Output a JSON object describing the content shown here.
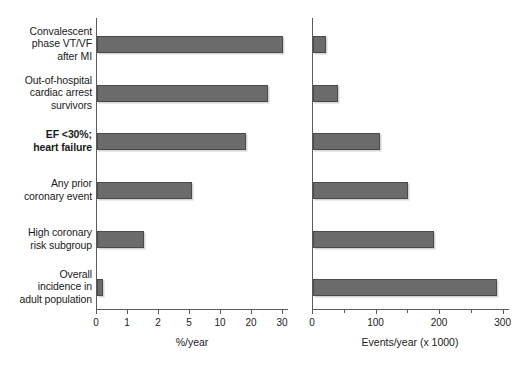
{
  "chart_data": {
    "type": "bar",
    "title": "",
    "orientation": "horizontal",
    "grid": false,
    "legend": null,
    "categories": [
      "Convalescent phase VT/VF after MI",
      "Out-of-hospital cardiac arrest survivors",
      "EF <30%; heart failure",
      "Any prior coronary event",
      "High coronary risk subgroup",
      "Overall incidence in adult population"
    ],
    "panels": [
      {
        "id": "percent-per-year",
        "xlabel": "%/year",
        "xticklabels": [
          "0",
          "1",
          "2",
          "5",
          "10",
          "20",
          "30"
        ],
        "xtickvalues": [
          0,
          1,
          2,
          5,
          10,
          20,
          30
        ],
        "scale": "ordinal-compressed",
        "values": [
          32,
          25,
          18,
          5.3,
          1.5,
          0.2
        ]
      },
      {
        "id": "events-per-year",
        "xlabel": "Events/year (x 1000)",
        "xticklabels": [
          "0",
          "100",
          "200",
          "300"
        ],
        "xtickvalues": [
          0,
          100,
          200,
          300
        ],
        "xminorticks": [
          50,
          150,
          250
        ],
        "xlim": [
          0,
          310
        ],
        "scale": "linear",
        "values": [
          20,
          40,
          105,
          150,
          190,
          290
        ]
      }
    ]
  },
  "labels": {
    "rows": [
      {
        "lines": [
          "Convalescent",
          "phase VT/VF",
          "after MI"
        ],
        "bold": false
      },
      {
        "lines": [
          "Out-of-hospital",
          "cardiac arrest",
          "survivors"
        ],
        "bold": false
      },
      {
        "lines": [
          "EF <30%;",
          "heart failure"
        ],
        "bold": true
      },
      {
        "lines": [
          "Any prior",
          "coronary event"
        ],
        "bold": false
      },
      {
        "lines": [
          "High coronary",
          "risk subgroup"
        ],
        "bold": false
      },
      {
        "lines": [
          "Overall",
          "incidence in",
          "adult population"
        ],
        "bold": false
      }
    ]
  },
  "axis_titles": {
    "left": "%/year",
    "right": "Events/year (x 1000)"
  },
  "colors": {
    "bar_fill": "#6b6b6b",
    "bar_edge": "#4a4a4a",
    "axis": "#5a5a5a",
    "text": "#1a1a1a",
    "background": "#ffffff"
  }
}
